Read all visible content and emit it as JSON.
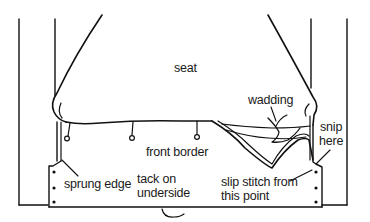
{
  "diagram": {
    "stroke_color": "#111111",
    "background": "#ffffff",
    "labels": {
      "seat": "seat",
      "wadding": "wadding",
      "front_border": "front border",
      "snip_line1": "snip",
      "snip_line2": "here",
      "sprung_edge": "sprung edge",
      "tack_line1": "tack on",
      "tack_line2": "underside",
      "slip_line1": "slip stitch from",
      "slip_line2": "this point"
    }
  }
}
